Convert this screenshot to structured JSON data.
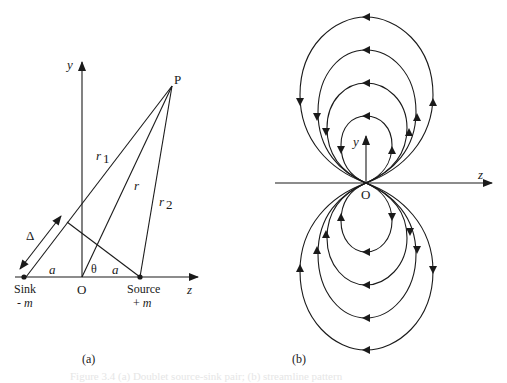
{
  "figure_a": {
    "caption": "(a)",
    "axis_labels": {
      "y": "y",
      "z": "z"
    },
    "point_P": "P",
    "origin": "O",
    "distances": {
      "r1_base": "r",
      "r1_sub": "1",
      "r": "r",
      "r2_base": "r",
      "r2_sub": "2",
      "delta": "Δ",
      "a_left": "a",
      "a_right": "a"
    },
    "angle": "θ",
    "sink": {
      "label": "Sink",
      "strength": "- m",
      "strength_sign": "- ",
      "strength_var": "m"
    },
    "source": {
      "label": "Source",
      "strength": "+ m",
      "strength_sign": "+ ",
      "strength_var": "m"
    }
  },
  "figure_b": {
    "caption": "(b)",
    "axis_labels": {
      "y": "y",
      "z": "z"
    },
    "origin": "O",
    "streamline_loops_per_half": 4
  },
  "bleed_text": "Figure 3.4 (a) Doublet source-sink pair; (b) streamline pattern"
}
